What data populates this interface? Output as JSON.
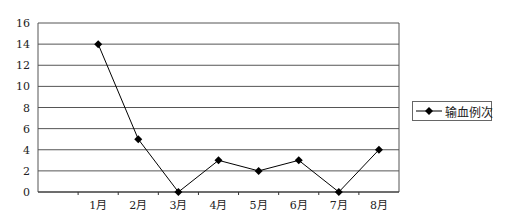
{
  "chart_data": {
    "type": "line",
    "title": "",
    "xlabel": "",
    "ylabel": "",
    "categories": [
      "",
      "1月",
      "2月",
      "3月",
      "4月",
      "5月",
      "6月",
      "7月",
      "8月"
    ],
    "series": [
      {
        "name": "输血例次",
        "values": [
          null,
          14,
          5,
          0,
          3,
          2,
          3,
          0,
          4
        ],
        "marker": "diamond",
        "color": "#000000"
      }
    ],
    "ylim": [
      0,
      16
    ],
    "yticks": [
      0,
      2,
      4,
      6,
      8,
      10,
      12,
      14,
      16
    ],
    "grid": true,
    "legend_position": "right"
  },
  "legend": {
    "label": "输血例次"
  }
}
